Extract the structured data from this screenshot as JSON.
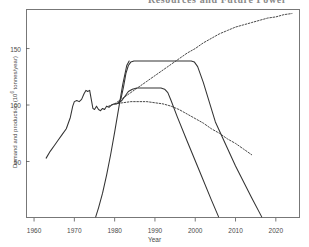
{
  "page_header": {
    "text": "Resources and Future Power"
  },
  "figure": {
    "xlabel": "Year",
    "ylabel_prefix": "Demand and production (10",
    "ylabel_exp": "6",
    "ylabel_suffix": " tonnes/year)",
    "ylabel_full": "Demand and production (10^6 tonnes/year)",
    "xticks": [
      "1960",
      "1970",
      "1980",
      "1990",
      "2000",
      "2010",
      "2020"
    ],
    "yticks": [
      "50",
      "100",
      "150"
    ],
    "line_color": "#333333",
    "frame_color": "#777777"
  },
  "chart_data": {
    "type": "line",
    "title": "",
    "subtitle": "",
    "xlabel": "Year",
    "ylabel": "Demand and production (10^6 tonnes/year)",
    "xlim": [
      1958,
      2026
    ],
    "ylim": [
      0,
      185
    ],
    "xticks": [
      1960,
      1970,
      1980,
      1990,
      2000,
      2010,
      2020
    ],
    "yticks": [
      50,
      100,
      150
    ],
    "grid": false,
    "legend": null,
    "series": [
      {
        "name": "Historical demand and high demand projection",
        "style": "solid",
        "points": [
          [
            1963.0,
            53
          ],
          [
            1964.0,
            59
          ],
          [
            1965.0,
            64
          ],
          [
            1966.0,
            69
          ],
          [
            1967.0,
            74
          ],
          [
            1968.0,
            79
          ],
          [
            1969.0,
            89
          ],
          [
            1969.6,
            99
          ],
          [
            1970.0,
            103
          ],
          [
            1970.6,
            104
          ],
          [
            1971.2,
            103
          ],
          [
            1971.8,
            105
          ],
          [
            1972.4,
            110
          ],
          [
            1972.9,
            113
          ],
          [
            1973.3,
            112
          ],
          [
            1973.8,
            113
          ],
          [
            1974.2,
            105
          ],
          [
            1974.6,
            97
          ],
          [
            1975.0,
            96
          ],
          [
            1975.5,
            99
          ],
          [
            1976.0,
            96
          ],
          [
            1976.5,
            95
          ],
          [
            1977.0,
            97
          ],
          [
            1977.5,
            96
          ],
          [
            1978.0,
            99
          ],
          [
            1978.6,
            98
          ],
          [
            1979.2,
            100
          ],
          [
            1979.8,
            101
          ],
          [
            1980.4,
            101
          ],
          [
            1981.0,
            102
          ],
          [
            1981.6,
            106
          ],
          [
            1982.2,
            116
          ],
          [
            1982.8,
            128
          ],
          [
            1983.4,
            135
          ],
          [
            1984.0,
            138
          ],
          [
            1984.8,
            139
          ],
          [
            1986.0,
            139
          ],
          [
            1990.0,
            139
          ],
          [
            1995.0,
            139
          ],
          [
            1998.0,
            139
          ],
          [
            1999.0,
            139
          ],
          [
            1999.8,
            138
          ],
          [
            2000.6,
            134
          ],
          [
            2002.0,
            120
          ],
          [
            2005.0,
            85
          ],
          [
            2010.0,
            46
          ],
          [
            2014.0,
            18
          ],
          [
            2016.5,
            1
          ]
        ]
      },
      {
        "name": "Low demand projection",
        "style": "solid",
        "points": [
          [
            1981.0,
            102
          ],
          [
            1981.8,
            104
          ],
          [
            1982.6,
            108
          ],
          [
            1983.4,
            112
          ],
          [
            1984.4,
            114
          ],
          [
            1985.5,
            115
          ],
          [
            1988.0,
            115
          ],
          [
            1990.0,
            115
          ],
          [
            1991.5,
            115
          ],
          [
            1992.4,
            114
          ],
          [
            1993.2,
            111
          ],
          [
            1994.0,
            104
          ],
          [
            1995.5,
            90
          ],
          [
            1998.0,
            68
          ],
          [
            2001.0,
            42
          ],
          [
            2004.0,
            16
          ],
          [
            2005.8,
            1
          ]
        ]
      },
      {
        "name": "Cumulative production curve (rising, from 1975)",
        "style": "solid",
        "points": [
          [
            1975.3,
            1
          ],
          [
            1976.0,
            9
          ],
          [
            1977.0,
            22
          ],
          [
            1978.0,
            38
          ],
          [
            1979.0,
            56
          ],
          [
            1980.0,
            76
          ],
          [
            1981.0,
            97
          ],
          [
            1982.0,
            118
          ],
          [
            1983.0,
            135
          ],
          [
            1983.6,
            139
          ]
        ]
      },
      {
        "name": "Rising resource projection (dashed)",
        "style": "dashed",
        "points": [
          [
            1980.0,
            101
          ],
          [
            1982.0,
            106
          ],
          [
            1984.0,
            111
          ],
          [
            1986.0,
            116
          ],
          [
            1988.0,
            121
          ],
          [
            1990.0,
            126
          ],
          [
            1992.0,
            131
          ],
          [
            1994.0,
            136
          ],
          [
            1996.0,
            141
          ],
          [
            1998.0,
            146
          ],
          [
            2000.0,
            150
          ],
          [
            2002.0,
            155
          ],
          [
            2004.0,
            159
          ],
          [
            2006.0,
            163
          ],
          [
            2008.0,
            166
          ],
          [
            2010.0,
            169
          ],
          [
            2012.0,
            171
          ],
          [
            2014.0,
            173
          ],
          [
            2016.0,
            175
          ],
          [
            2018.0,
            177
          ],
          [
            2020.0,
            178
          ],
          [
            2022.0,
            180
          ],
          [
            2024.0,
            181
          ]
        ]
      },
      {
        "name": "Declining production projection (dashed)",
        "style": "dashed",
        "points": [
          [
            1978.5,
            99
          ],
          [
            1980.0,
            101
          ],
          [
            1982.0,
            102
          ],
          [
            1984.0,
            103
          ],
          [
            1986.0,
            103
          ],
          [
            1988.0,
            103
          ],
          [
            1990.0,
            102
          ],
          [
            1992.0,
            101
          ],
          [
            1994.0,
            99
          ],
          [
            1996.0,
            96
          ],
          [
            1998.0,
            92
          ],
          [
            2000.0,
            88
          ],
          [
            2002.0,
            84
          ],
          [
            2004.0,
            79
          ],
          [
            2006.0,
            75
          ],
          [
            2008.0,
            70
          ],
          [
            2010.0,
            66
          ],
          [
            2012.0,
            61
          ],
          [
            2014.0,
            56
          ]
        ]
      }
    ]
  }
}
